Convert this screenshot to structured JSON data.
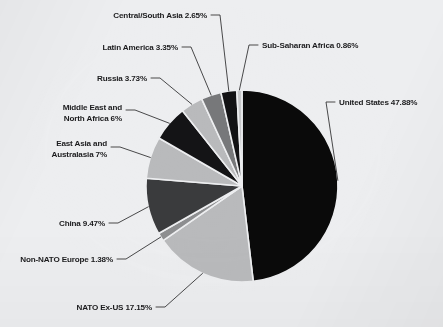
{
  "chart_data": {
    "type": "pie",
    "title": "",
    "subtitle": "",
    "xlabel": "",
    "ylabel": "",
    "legend_position": "none",
    "labels_style": "external-with-leader-lines",
    "start_angle_deg": 0,
    "direction": "clockwise",
    "categories": [
      "United States",
      "NATO Ex-US",
      "Non-NATO Europe",
      "China",
      "East Asia and Australasia",
      "Middle East and North Africa",
      "Russia",
      "Latin America",
      "Central/South Asia",
      "Sub-Saharan Africa"
    ],
    "values": [
      47.88,
      17.15,
      1.38,
      9.47,
      7,
      6,
      3.73,
      3.35,
      2.65,
      0.86
    ],
    "value_suffix": "%",
    "slice_colors": [
      "#0a0a0a",
      "#b9babc",
      "#8d8e90",
      "#3a3b3d",
      "#b9babc",
      "#141416",
      "#b9babc",
      "#77787a",
      "#121214",
      "#c6c7c9"
    ],
    "slices": [
      {
        "label": "United States 47.88%",
        "name": "United States",
        "value": 47.88,
        "color": "#0a0a0a"
      },
      {
        "label": "NATO Ex-US 17.15%",
        "name": "NATO Ex-US",
        "value": 17.15,
        "color": "#b9babc"
      },
      {
        "label": "Non-NATO Europe 1.38%",
        "name": "Non-NATO Europe",
        "value": 1.38,
        "color": "#8d8e90"
      },
      {
        "label": "China 9.47%",
        "name": "China",
        "value": 9.47,
        "color": "#3a3b3d"
      },
      {
        "label": "East Asia and Australasia 7%",
        "name": "East Asia and Australasia",
        "value": 7,
        "color": "#b9babc"
      },
      {
        "label": "Middle East and North Africa 6%",
        "name": "Middle East and North Africa",
        "value": 6,
        "color": "#141416"
      },
      {
        "label": "Russia 3.73%",
        "name": "Russia",
        "value": 3.73,
        "color": "#b9babc"
      },
      {
        "label": "Latin America 3.35%",
        "name": "Latin America",
        "value": 3.35,
        "color": "#77787a"
      },
      {
        "label": "Central/South Asia 2.65%",
        "name": "Central/South Asia",
        "value": 2.65,
        "color": "#121214"
      },
      {
        "label": "Sub-Saharan Africa 0.86%",
        "name": "Sub-Saharan Africa",
        "value": 0.86,
        "color": "#c6c7c9"
      }
    ]
  },
  "labels": {
    "central_south_asia": "Central/South Asia 2.65%",
    "latin_america": "Latin America 3.35%",
    "russia": "Russia 3.73%",
    "middle_east_line1": "Middle East and",
    "middle_east_line2": "North Africa 6%",
    "east_asia_line1": "East Asia and",
    "east_asia_line2": "Australasia 7%",
    "china": "China 9.47%",
    "non_nato_europe": "Non-NATO Europe 1.38%",
    "nato_ex_us": "NATO Ex-US 17.15%",
    "sub_saharan_africa": "Sub-Saharan Africa 0.86%",
    "united_states": "United States 47.88%"
  },
  "colors": {
    "background": "#edeef0",
    "text": "#1b1b1d",
    "leader_line": "#2a2a2c"
  }
}
